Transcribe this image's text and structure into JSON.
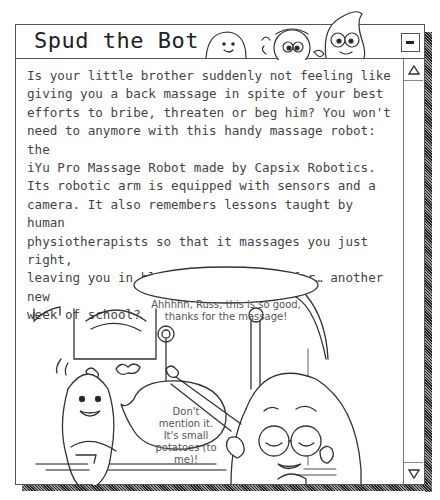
{
  "window": {
    "title": "Spud the Bot",
    "minimize_label": "minimize",
    "body_text": "Is your little brother suddenly not feeling like\ngiving you a back massage in spite of your best\nefforts to bribe, threaten or beg him? You won't\nneed to anymore with this handy massage robot: the\niYu Pro Massage Robot made by Capsix Robotics.\nIts robotic arm is equipped with sensors and a\ncamera. It also remembers lessons taught by human\nphysiotherapists so that it massages you just right,\nleaving you in bliss and all ready for… another new\nweek of school?"
  },
  "comic": {
    "bubble_1": "Ahhhhh, Russ, this is so good, thanks for the massage!",
    "bubble_2": "Don't mention it. It's small potatoes (to me)!"
  },
  "scrollbar": {
    "up_icon": "triangle-up",
    "down_icon": "triangle-down"
  },
  "colors": {
    "frame": "#555555",
    "shadow": "#222222",
    "text": "#444444",
    "background": "#ffffff"
  }
}
